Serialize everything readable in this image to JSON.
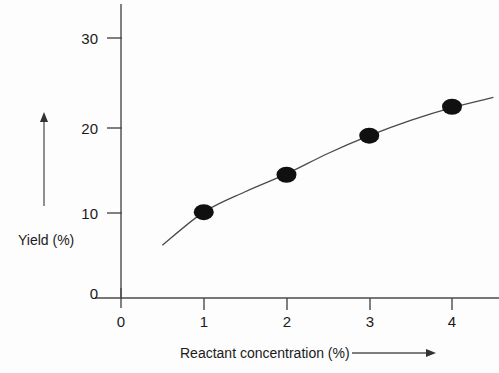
{
  "chart_data": {
    "type": "scatter",
    "title": "",
    "subtitle": "",
    "xlabel": "Reactant concentration (%)",
    "ylabel": "Yield (%)",
    "xlim": [
      0,
      4.6
    ],
    "ylim": [
      0,
      32
    ],
    "grid": false,
    "legend": null,
    "x_ticks": [
      "0",
      "1",
      "2",
      "3",
      "4"
    ],
    "x_tick_values": [
      0,
      1,
      2,
      3,
      4
    ],
    "y_ticks": [
      "0",
      "10",
      "20",
      "30"
    ],
    "y_tick_values": [
      0,
      10,
      20,
      30
    ],
    "x": [
      1,
      2,
      3,
      4
    ],
    "values": [
      10.1,
      14.5,
      19.1,
      22.5
    ],
    "series": [
      {
        "name": "Observed yield",
        "x": [
          1,
          2,
          3,
          4
        ],
        "values": [
          10.1,
          14.5,
          19.1,
          22.5
        ],
        "marker": "filled-ellipse",
        "color": "#101010"
      },
      {
        "name": "Fitted curve",
        "type": "line",
        "x": [
          0.5,
          1.0,
          1.5,
          2.0,
          2.5,
          3.0,
          3.5,
          4.0,
          4.5
        ],
        "values": [
          6.2,
          10.1,
          12.5,
          14.6,
          17.0,
          19.1,
          20.9,
          22.4,
          23.6
        ],
        "color": "#4a4a4a"
      }
    ],
    "annotations": [
      {
        "name": "y-direction-arrow",
        "orientation": "up",
        "description": "vertical arrow beside Yield axis pointing up"
      },
      {
        "name": "x-direction-arrow",
        "orientation": "right",
        "description": "horizontal arrow after x-axis label pointing right"
      }
    ]
  },
  "axes": {
    "y_title": "Yield (%)",
    "x_title": "Reactant concentration (%)",
    "y_tick_labels": [
      "30",
      "20",
      "10",
      "0"
    ],
    "x_tick_labels": [
      "0",
      "1",
      "2",
      "3",
      "4"
    ]
  },
  "colors": {
    "background": "#fdfdfd",
    "axis": "#4a4a4a",
    "marker": "#101010",
    "curve": "#4a4a4a",
    "text": "#1a1a1a",
    "arrow": "#555555"
  }
}
